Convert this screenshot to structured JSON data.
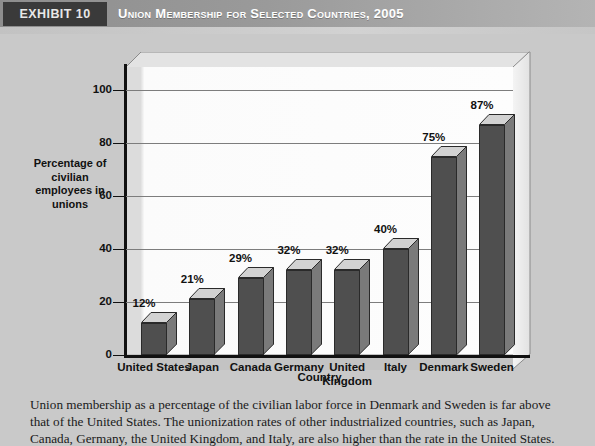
{
  "header": {
    "exhibit_tag": "EXHIBIT 10",
    "title": "Union Membership for Selected Countries, 2005",
    "tag_bg": "#3a3a3a",
    "bar_bg": "#9a9a9a"
  },
  "chart_data": {
    "type": "bar",
    "title": "Union Membership for Selected Countries, 2005",
    "xlabel": "Country",
    "ylabel": "Percentage of civilian employees in unions",
    "ylim": [
      0,
      110
    ],
    "yticks": [
      0,
      20,
      40,
      60,
      80,
      100
    ],
    "ytick_labels": [
      "0",
      "20",
      "40",
      "60",
      "80",
      "100"
    ],
    "grid": true,
    "legend": "none",
    "categories": [
      "United States",
      "Japan",
      "Canada",
      "Germany",
      "United Kingdom",
      "Italy",
      "Denmark",
      "Sweden"
    ],
    "values": [
      12,
      21,
      29,
      32,
      32,
      40,
      75,
      87
    ],
    "data_labels": [
      "12%",
      "21%",
      "29%",
      "32%",
      "32%",
      "40%",
      "75%",
      "87%"
    ],
    "bar_front_color": "#4f4f4f",
    "bar_side_color": "#7a7a7a",
    "bar_top_color": "#d2d2d2"
  },
  "caption": "Union membership as a percentage of the civilian labor force in Denmark and Sweden is far above that of the United States. The unionization rates of other industrialized countries, such as Japan, Canada, Germany, the United Kingdom, and Italy, are also higher than the rate in the United States."
}
